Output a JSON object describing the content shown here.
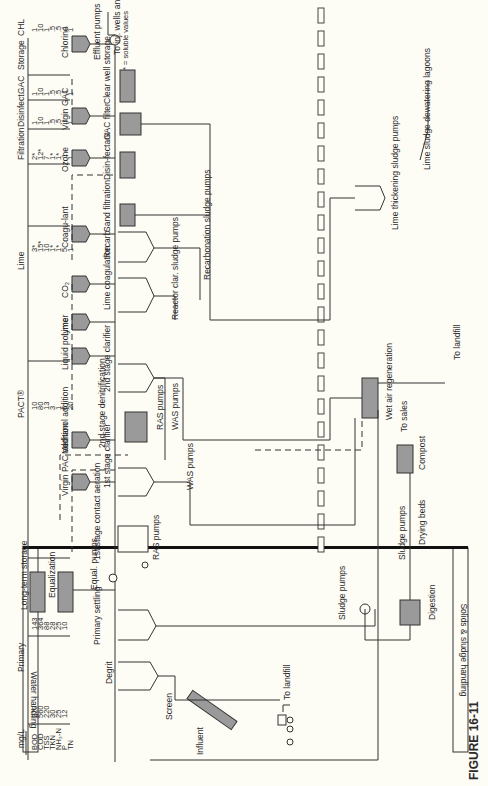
{
  "figure_label": "FIGURE 16-11",
  "footnote": "* = soluble values",
  "bands": {
    "water": "Water handling",
    "solids": "Solids & sludge handling"
  },
  "table": {
    "units_label": "mg/L",
    "parameters": [
      "BOD",
      "COD",
      "TSS",
      "TKN",
      "NH₃-N",
      "P",
      "TN"
    ],
    "columns": [
      {
        "stage": "Primary",
        "values": [
          "220",
          "560",
          "220",
          "30",
          "25",
          "12",
          ""
        ]
      },
      {
        "stage": "",
        "values": [
          "143",
          "364",
          "88",
          "28",
          "25",
          "10",
          ""
        ]
      },
      {
        "stage": "PACT®",
        "values": [
          "10",
          "80",
          "13",
          "3",
          "1",
          "6",
          "20"
        ]
      },
      {
        "stage": "Lime",
        "values": [
          "3*",
          "15*",
          "10",
          "1*",
          "1*",
          "5",
          "1"
        ]
      },
      {
        "stage": "Filtration",
        "values": [
          "2*",
          "12*",
          "7",
          "1*",
          "1*",
          ".1",
          "1"
        ]
      },
      {
        "stage": "Disinfect.",
        "values": [
          "1",
          "10",
          "1",
          ".5",
          ".5",
          ".1",
          "1"
        ]
      },
      {
        "stage": "GAC",
        "values": [
          "1",
          "10",
          "1",
          ".5",
          ".5",
          ".1",
          "1"
        ]
      },
      {
        "stage": "Storage",
        "values": []
      },
      {
        "stage": "CHL",
        "values": [
          "1",
          "10",
          "1",
          ".5",
          ".5",
          ".1",
          "1"
        ]
      }
    ]
  },
  "chemicals": [
    "Virgin PAC addition",
    "Methanol addition",
    "Liquid polymer",
    "Lime",
    "CO₂",
    "Coagu-lant",
    "Ozone",
    "Virgin GAC",
    "Chlorine"
  ],
  "process": {
    "influent": "Influent",
    "screen": "Screen",
    "degrit": "Degrit",
    "to_landfill_1": "To landfill",
    "primary_settling": "Primary settling",
    "equal_pumps": "Equal. pumps",
    "equalization": "Equalization",
    "long_term_storage": "Long-term storage",
    "aeration": "1st stage contact aeration",
    "ras_pumps_1": "RAS pumps",
    "clarifier_1": "1st stage clarifier",
    "was_pumps_1": "WAS pumps",
    "denitrification": "2nd stage denitrification",
    "ras_pumps_2": "RAS pumps",
    "was_pumps_2": "WAS pumps",
    "clarifier_2": "2nd stage clarifier",
    "lime_coagulation": "Lime coagulation",
    "reactor_pumps": "Reactor clar. sludge pumps",
    "recarb": "Recarb",
    "recarb_pumps": "Recarbonation sludge pumps",
    "sand_filtration": "Sand filtration",
    "disinfectant": "Disin-fectant",
    "gac_filter": "GAC filter",
    "clear_well": "Clear well storage",
    "effluent_pumps": "Effluent pumps",
    "to_wells": "To inj. wells and to indust."
  },
  "solids": {
    "sludge_pumps_1": "Sludge pumps",
    "digestion": "Digestion",
    "sludge_pumps_2": "Sludge pumps",
    "drying_beds": "Drying beds",
    "compost": "Compost",
    "to_sales": "To sales",
    "wet_air": "Wet air regeneration",
    "to_landfill_2": "To landfill",
    "lime_thickening": "Lime thickening sludge pumps",
    "lime_lagoons": "Lime sludge dewatering lagoons"
  }
}
